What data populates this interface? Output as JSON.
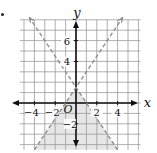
{
  "figure": {
    "marker": "•",
    "x_axis_label": "x",
    "y_axis_label": "y",
    "origin_label": "O",
    "x_tick_labels": [
      {
        "value": -4,
        "text": "−4"
      },
      {
        "value": -2,
        "text": "−2"
      },
      {
        "value": 2,
        "text": "2"
      },
      {
        "value": 4,
        "text": "4"
      }
    ],
    "y_tick_labels": [
      {
        "value": 6,
        "text": "6"
      },
      {
        "value": 4,
        "text": "4"
      },
      {
        "value": -2,
        "text": "−2"
      }
    ],
    "grid": {
      "x_min": -5,
      "x_max": 6,
      "y_min": -4,
      "y_max": 8,
      "step": 1
    },
    "lines": [
      {
        "name": "line-negative-slope",
        "equation": "y = -1.5x + 1.5",
        "slope": -1.5,
        "intercept": 1.5,
        "style": "dashed"
      },
      {
        "name": "line-positive-slope",
        "equation": "y = 1.5x + 1.5",
        "slope": 1.5,
        "intercept": 1.5,
        "style": "dashed"
      }
    ],
    "shaded_region": "below both lines",
    "colors": {
      "grid": "#9a9a9a",
      "axis": "#111111",
      "dashed_line": "#8a8a8a",
      "shade": "#e6e6e6"
    }
  }
}
